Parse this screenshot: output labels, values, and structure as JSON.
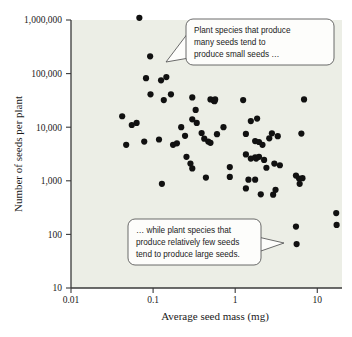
{
  "chart_data": {
    "type": "scatter",
    "title": "",
    "xlabel": "Average seed mass (mg)",
    "ylabel": "Number of seeds per plant",
    "xscale": "log",
    "yscale": "log",
    "xlim": [
      0.01,
      20
    ],
    "ylim": [
      10,
      1000000
    ],
    "xticks": [
      0.01,
      0.1,
      1,
      10
    ],
    "xtick_labels": [
      "0.01",
      "0.1",
      "1",
      "10"
    ],
    "yticks": [
      10,
      100,
      1000,
      10000,
      100000,
      1000000
    ],
    "ytick_labels": [
      "10",
      "100",
      "1,000",
      "10,000",
      "100,000",
      "1,000,000"
    ],
    "grid": false,
    "legend": "none",
    "marker": "filled-circle",
    "marker_color": "#111111",
    "background_color": "#eceee6",
    "points": [
      [
        0.068,
        1100000
      ],
      [
        0.092,
        210000
      ],
      [
        0.082,
        82000
      ],
      [
        0.125,
        75000
      ],
      [
        0.145,
        86000
      ],
      [
        0.093,
        41000
      ],
      [
        0.135,
        32000
      ],
      [
        0.165,
        41000
      ],
      [
        0.3,
        36000
      ],
      [
        0.33,
        21000
      ],
      [
        0.5,
        33000
      ],
      [
        0.55,
        31000
      ],
      [
        0.56,
        30500
      ],
      [
        0.57,
        33000
      ],
      [
        1.25,
        32000
      ],
      [
        6.9,
        33000
      ],
      [
        0.042,
        16000
      ],
      [
        0.055,
        11000
      ],
      [
        0.063,
        12000
      ],
      [
        0.3,
        14000
      ],
      [
        0.34,
        12000
      ],
      [
        0.22,
        10000
      ],
      [
        0.72,
        10000
      ],
      [
        1.55,
        13000
      ],
      [
        1.85,
        14500
      ],
      [
        0.047,
        4700
      ],
      [
        0.078,
        5400
      ],
      [
        0.118,
        5900
      ],
      [
        0.175,
        4700
      ],
      [
        0.195,
        5000
      ],
      [
        0.245,
        6900
      ],
      [
        0.39,
        7800
      ],
      [
        0.42,
        6100
      ],
      [
        0.47,
        5400
      ],
      [
        0.5,
        5100
      ],
      [
        0.6,
        7400
      ],
      [
        1.35,
        7500
      ],
      [
        1.75,
        5500
      ],
      [
        1.95,
        5300
      ],
      [
        2.15,
        4700
      ],
      [
        2.6,
        6200
      ],
      [
        2.8,
        7700
      ],
      [
        3.3,
        6800
      ],
      [
        6.4,
        7600
      ],
      [
        0.255,
        2800
      ],
      [
        0.285,
        2100
      ],
      [
        0.3,
        1700
      ],
      [
        0.44,
        1150
      ],
      [
        0.86,
        1800
      ],
      [
        0.86,
        1180
      ],
      [
        1.35,
        3100
      ],
      [
        1.55,
        2600
      ],
      [
        1.75,
        2750
      ],
      [
        1.8,
        2600
      ],
      [
        1.95,
        2800
      ],
      [
        2.25,
        2450
      ],
      [
        2.4,
        1750
      ],
      [
        3.0,
        2100
      ],
      [
        3.5,
        1950
      ],
      [
        1.35,
        720
      ],
      [
        1.45,
        1050
      ],
      [
        1.75,
        1050
      ],
      [
        3.1,
        680
      ],
      [
        2.05,
        560
      ],
      [
        2.9,
        550
      ],
      [
        5.5,
        1250
      ],
      [
        6.0,
        1100
      ],
      [
        6.6,
        1120
      ],
      [
        6.1,
        880
      ],
      [
        0.128,
        880
      ],
      [
        5.5,
        140
      ],
      [
        5.6,
        66
      ],
      [
        17.0,
        250
      ],
      [
        17.2,
        150
      ]
    ],
    "annotations": [
      {
        "name": "top-callout",
        "lines": [
          "Plant species that produce",
          "many seeds tend to",
          "produce small seeds …"
        ]
      },
      {
        "name": "bottom-callout",
        "lines": [
          "… while plant species that",
          "produce relatively few seeds",
          "tend to produce large seeds."
        ]
      }
    ]
  }
}
